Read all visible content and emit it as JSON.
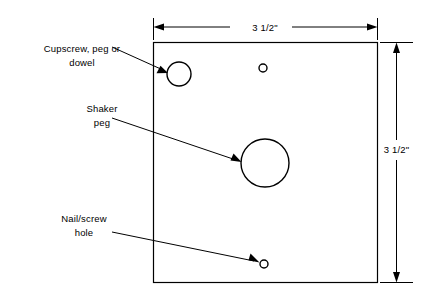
{
  "diagram": {
    "type": "technical-drawing",
    "board": {
      "shape": "square",
      "width_label": "3 1/2\"",
      "height_label": "3 1/2\"",
      "x": 153,
      "y": 42,
      "w": 225,
      "h": 241,
      "stroke_color": "#000000"
    },
    "dimensions": [
      {
        "name": "width-dimension",
        "label": "3 1/2\"",
        "orientation": "horizontal",
        "position": "top"
      },
      {
        "name": "height-dimension",
        "label": "3 1/2\"",
        "orientation": "vertical",
        "position": "right"
      }
    ],
    "callouts": [
      {
        "name": "cupscrew-callout",
        "lines": [
          "Cupscrew, peg or",
          "dowel"
        ],
        "text": "Cupscrew, peg or dowel",
        "points_to": "cupscrew-hole"
      },
      {
        "name": "shaker-peg-callout",
        "lines": [
          "Shaker",
          "peg"
        ],
        "text": "Shaker peg",
        "points_to": "shaker-peg-hole"
      },
      {
        "name": "nail-screw-callout",
        "lines": [
          "Nail/screw",
          "hole"
        ],
        "text": "Nail/screw hole",
        "points_to": "nail-screw-hole"
      }
    ],
    "holes": [
      {
        "name": "cupscrew-hole",
        "cx": 179,
        "cy": 74,
        "r": 12,
        "kind": "cupscrew-peg-or-dowel"
      },
      {
        "name": "top-small-hole",
        "cx": 263,
        "cy": 68,
        "r": 4,
        "kind": "nail-screw-hole"
      },
      {
        "name": "shaker-peg-hole",
        "cx": 265,
        "cy": 163,
        "r": 24,
        "kind": "shaker-peg"
      },
      {
        "name": "nail-screw-hole",
        "cx": 264,
        "cy": 264,
        "r": 4,
        "kind": "nail-screw-hole"
      }
    ]
  }
}
